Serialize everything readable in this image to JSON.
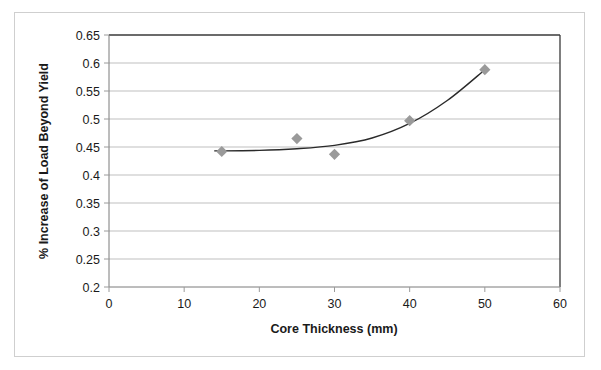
{
  "chart_data": {
    "type": "scatter",
    "title": "",
    "xlabel": "Core Thickness (mm)",
    "ylabel": "% Increase of Load Beyond Yield",
    "xlim": [
      0,
      60
    ],
    "ylim": [
      0.2,
      0.65
    ],
    "xticks": [
      "0",
      "10",
      "20",
      "30",
      "40",
      "50",
      "60"
    ],
    "yticks": [
      "0.2",
      "0.25",
      "0.3",
      "0.35",
      "0.4",
      "0.45",
      "0.5",
      "0.55",
      "0.6",
      "0.65"
    ],
    "grid": "horizontal",
    "legend": "none",
    "x": [
      15,
      25,
      30,
      40,
      50
    ],
    "values": [
      0.442,
      0.465,
      0.437,
      0.497,
      0.588
    ],
    "series": [
      {
        "name": "Data points",
        "marker": "diamond",
        "marker_color": "#9a9a9a",
        "x": [
          15,
          25,
          30,
          40,
          50
        ],
        "values": [
          0.442,
          0.465,
          0.437,
          0.497,
          0.588
        ]
      },
      {
        "name": "Trendline",
        "marker": "none",
        "line_color": "#2a2a2a",
        "x": [
          14,
          20,
          25,
          30,
          35,
          40,
          45,
          50
        ],
        "values": [
          0.443,
          0.444,
          0.447,
          0.453,
          0.466,
          0.492,
          0.533,
          0.588
        ]
      }
    ],
    "annotations": []
  },
  "figure": {
    "border_color": "#cfcfcf",
    "background": "#ffffff",
    "plot_border_color": "#3a3a3a",
    "gridline_color": "#b8b8b8"
  }
}
